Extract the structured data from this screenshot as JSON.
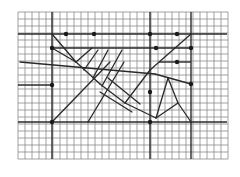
{
  "diagram": {
    "type": "grid-geometry-figure",
    "background": "#ffffff",
    "grid": {
      "x0": 18,
      "y0": 12,
      "cell": 7,
      "cols": 30,
      "rows": 21,
      "line_color": "#8a8a8a",
      "axis_color": "#2a2a2a"
    },
    "bold_vertical": [
      52,
      150,
      191
    ],
    "bold_horizontal": [
      {
        "y": 34,
        "x1": 18,
        "x2": 227
      },
      {
        "y": 48,
        "x1": 52,
        "x2": 191
      },
      {
        "y": 62,
        "x1": 159,
        "x2": 191
      },
      {
        "y": 85,
        "x1": 18,
        "x2": 52
      },
      {
        "y": 122,
        "x1": 18,
        "x2": 227
      }
    ],
    "segments": [
      [
        52,
        34,
        76,
        62
      ],
      [
        52,
        48,
        76,
        62
      ],
      [
        76,
        62,
        100,
        84
      ],
      [
        100,
        84,
        125,
        103
      ],
      [
        125,
        103,
        156,
        118
      ],
      [
        156,
        118,
        178,
        103
      ],
      [
        178,
        103,
        191,
        122
      ],
      [
        76,
        62,
        92,
        48
      ],
      [
        84,
        70,
        98,
        50
      ],
      [
        93,
        78,
        108,
        50
      ],
      [
        102,
        86,
        122,
        50
      ],
      [
        20,
        62,
        155,
        74
      ],
      [
        155,
        74,
        191,
        84
      ],
      [
        52,
        122,
        110,
        62
      ],
      [
        88,
        122,
        124,
        62
      ],
      [
        125,
        103,
        150,
        70
      ],
      [
        150,
        70,
        191,
        34
      ],
      [
        156,
        118,
        168,
        78
      ],
      [
        168,
        78,
        178,
        103
      ],
      [
        108,
        78,
        140,
        104
      ],
      [
        100,
        92,
        132,
        112
      ]
    ],
    "points": [
      [
        66,
        34
      ],
      [
        94,
        34
      ],
      [
        150,
        34
      ],
      [
        177,
        34
      ],
      [
        52,
        48
      ],
      [
        156,
        48
      ],
      [
        191,
        48
      ],
      [
        177,
        62
      ],
      [
        52,
        85
      ],
      [
        52,
        122
      ],
      [
        150,
        122
      ],
      [
        191,
        84
      ],
      [
        150,
        92
      ]
    ],
    "point_color": "#1a1a1a",
    "line_color": "#2a2a2a"
  }
}
